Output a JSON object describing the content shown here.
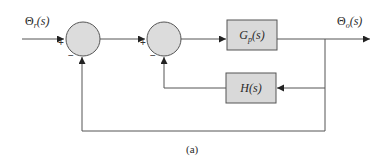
{
  "diagram": {
    "type": "block-diagram",
    "caption": "(a)",
    "input": {
      "symbol": "Θ",
      "sub": "r",
      "arg": "(s)"
    },
    "output": {
      "symbol": "Θ",
      "sub": "o",
      "arg": "(s)"
    },
    "summing_junctions": [
      {
        "id": "sum1",
        "signs": {
          "left": "+",
          "bottom": "−"
        }
      },
      {
        "id": "sum2",
        "signs": {
          "left": "+",
          "bottom": "−"
        }
      }
    ],
    "blocks": [
      {
        "id": "plant",
        "name": "G",
        "sub": "p",
        "arg": "(s)"
      },
      {
        "id": "feedback",
        "name": "H",
        "sub": "",
        "arg": "(s)"
      }
    ],
    "colors": {
      "block_fill": "#d9d9d9",
      "junction_fill": "#dcdcdc",
      "line": "#555555",
      "text": "#2a2a2a"
    }
  }
}
